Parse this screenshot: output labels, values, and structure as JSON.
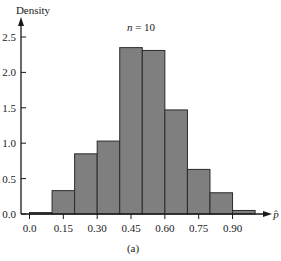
{
  "figure": {
    "annotation": "n = 10",
    "annotation_var": "n",
    "annotation_rest": " = 10",
    "caption": "(a)"
  },
  "chart_data": {
    "type": "bar",
    "subtype": "histogram",
    "title": "n = 10",
    "caption": "(a)",
    "xlabel": "p̂",
    "ylabel": "Density",
    "bin_edges": [
      0.0,
      0.1,
      0.2,
      0.3,
      0.4,
      0.5,
      0.6,
      0.7,
      0.8,
      0.9,
      1.0
    ],
    "categories": [
      "0.0–0.1",
      "0.1–0.2",
      "0.2–0.3",
      "0.3–0.4",
      "0.4–0.5",
      "0.5–0.6",
      "0.6–0.7",
      "0.7–0.8",
      "0.8–0.9",
      "0.9–1.0"
    ],
    "values": [
      0.02,
      0.33,
      0.85,
      1.03,
      2.35,
      2.31,
      1.47,
      0.63,
      0.3,
      0.05
    ],
    "xticks": [
      0.0,
      0.15,
      0.3,
      0.45,
      0.6,
      0.75,
      0.9
    ],
    "xtick_labels": [
      "0.0",
      "0.15",
      "0.30",
      "0.45",
      "0.60",
      "0.75",
      "0.90"
    ],
    "yticks": [
      0.0,
      0.5,
      1.0,
      1.5,
      2.0,
      2.5
    ],
    "ytick_labels": [
      "0.0",
      "0.5",
      "1.0",
      "1.5",
      "2.0",
      "2.5"
    ],
    "xlim": [
      0.0,
      1.07
    ],
    "ylim": [
      0.0,
      2.75
    ],
    "grid": false,
    "legend": null,
    "colors": {
      "bar_fill": "#7f7f7f",
      "bar_edge": "#2b2b2b",
      "axis": "#1a1a1a"
    }
  }
}
